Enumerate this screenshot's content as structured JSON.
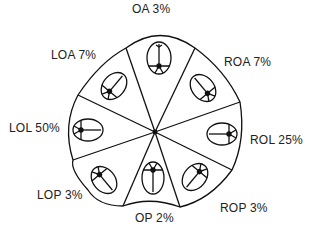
{
  "diagram": {
    "type": "fetal-head-positions",
    "center": "occiput positions of fetal head around pelvis outline",
    "labels": [
      {
        "id": "oa",
        "text": "OA 3%"
      },
      {
        "id": "roa",
        "text": "ROA 7%"
      },
      {
        "id": "rol",
        "text": "ROL 25%"
      },
      {
        "id": "rop",
        "text": "ROP 3%"
      },
      {
        "id": "op",
        "text": "OP 2%"
      },
      {
        "id": "lop",
        "text": "LOP 3%"
      },
      {
        "id": "lol",
        "text": "LOL 50%"
      },
      {
        "id": "loa",
        "text": "LOA 7%"
      }
    ]
  }
}
